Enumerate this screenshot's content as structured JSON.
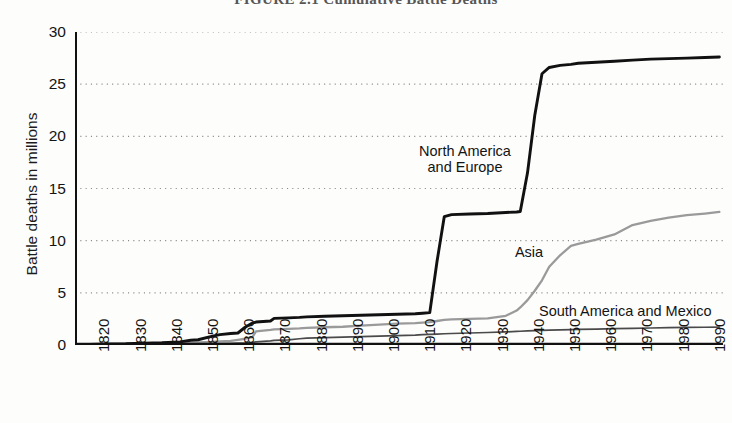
{
  "figure": {
    "title": "FIGURE 2.1  Cumulative Battle Deaths"
  },
  "axes": {
    "ylabel": "Battle deaths in millions",
    "xlabel": "",
    "y_ticks": [
      0,
      5,
      10,
      15,
      20,
      25,
      30
    ],
    "y_tick_labels": [
      "0",
      "5",
      "10",
      "15",
      "20",
      "25",
      "30"
    ],
    "x_ticks": [
      1820,
      1830,
      1840,
      1850,
      1860,
      1870,
      1880,
      1890,
      1900,
      1910,
      1920,
      1930,
      1940,
      1950,
      1960,
      1970,
      1980,
      1990
    ],
    "x_tick_labels": [
      "1820",
      "1830",
      "1840",
      "1850",
      "1860",
      "1870",
      "1880",
      "1890",
      "1900",
      "1910",
      "1920",
      "1930",
      "1940",
      "1950",
      "1960",
      "1970",
      "1980",
      "1990"
    ]
  },
  "annotations": {
    "north_america_europe": "North America\nand Europe",
    "asia": "Asia",
    "south_america_mexico": "South America and Mexico"
  },
  "colors": {
    "north_america_europe": "#111111",
    "asia": "#9a9a9a",
    "south_america_mexico": "#4a4a4a",
    "axis": "#111111",
    "gridline": "#8a8a8a",
    "background": "#fdfdfc"
  },
  "chart_data": {
    "type": "line",
    "title": "FIGURE 2.1  Cumulative Battle Deaths",
    "xlabel": "",
    "ylabel": "Battle deaths in millions",
    "xlim": [
      1816,
      1995
    ],
    "ylim": [
      0,
      30
    ],
    "grid": "horizontal-dotted",
    "legend": "inline-annotations",
    "x": [
      1816,
      1820,
      1825,
      1830,
      1835,
      1840,
      1845,
      1848,
      1850,
      1854,
      1856,
      1859,
      1861,
      1863,
      1865,
      1866,
      1870,
      1871,
      1875,
      1878,
      1880,
      1885,
      1890,
      1895,
      1900,
      1905,
      1910,
      1912,
      1914,
      1916,
      1918,
      1920,
      1925,
      1930,
      1935,
      1938,
      1939,
      1941,
      1943,
      1945,
      1947,
      1950,
      1953,
      1955,
      1960,
      1965,
      1970,
      1975,
      1980,
      1985,
      1990,
      1994
    ],
    "series": [
      {
        "name": "North America and Europe",
        "color": "#111111",
        "values": [
          0.0,
          0.05,
          0.1,
          0.12,
          0.18,
          0.22,
          0.3,
          0.45,
          0.5,
          0.85,
          1.0,
          1.1,
          1.15,
          1.7,
          2.1,
          2.2,
          2.3,
          2.55,
          2.6,
          2.65,
          2.7,
          2.75,
          2.8,
          2.85,
          2.9,
          2.95,
          3.0,
          3.05,
          3.1,
          8.0,
          12.3,
          12.5,
          12.55,
          12.6,
          12.7,
          12.75,
          12.8,
          16.5,
          22.0,
          26.0,
          26.6,
          26.8,
          26.9,
          27.0,
          27.1,
          27.2,
          27.3,
          27.4,
          27.45,
          27.5,
          27.55,
          27.6
        ]
      },
      {
        "name": "Asia",
        "color": "#9a9a9a",
        "values": [
          0.0,
          0.02,
          0.03,
          0.05,
          0.07,
          0.1,
          0.15,
          0.2,
          0.25,
          0.3,
          0.35,
          0.4,
          0.5,
          0.6,
          0.75,
          1.3,
          1.45,
          1.5,
          1.55,
          1.6,
          1.65,
          1.7,
          1.75,
          1.85,
          1.95,
          2.05,
          2.1,
          2.15,
          2.2,
          2.3,
          2.4,
          2.45,
          2.5,
          2.55,
          2.8,
          3.3,
          3.6,
          4.3,
          5.2,
          6.2,
          7.5,
          8.6,
          9.5,
          9.7,
          10.1,
          10.6,
          11.5,
          11.9,
          12.2,
          12.45,
          12.6,
          12.75
        ]
      },
      {
        "name": "South America and Mexico",
        "color": "#4a4a4a",
        "values": [
          0.0,
          0.01,
          0.02,
          0.03,
          0.04,
          0.05,
          0.07,
          0.09,
          0.1,
          0.12,
          0.14,
          0.16,
          0.18,
          0.2,
          0.24,
          0.3,
          0.4,
          0.45,
          0.5,
          0.6,
          0.65,
          0.7,
          0.75,
          0.8,
          0.85,
          0.9,
          0.95,
          1.0,
          1.02,
          1.05,
          1.08,
          1.1,
          1.15,
          1.2,
          1.25,
          1.3,
          1.32,
          1.35,
          1.38,
          1.4,
          1.42,
          1.45,
          1.48,
          1.5,
          1.53,
          1.56,
          1.6,
          1.63,
          1.66,
          1.68,
          1.7,
          1.72
        ]
      }
    ]
  }
}
